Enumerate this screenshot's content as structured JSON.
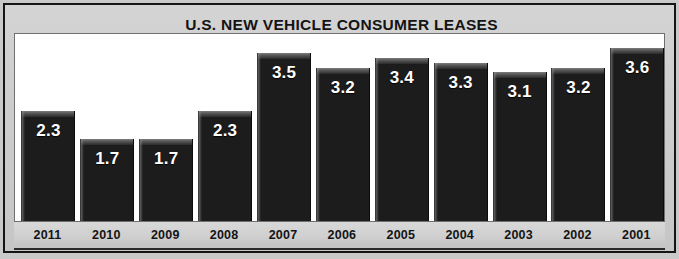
{
  "chart_data": {
    "type": "bar",
    "title": "U.S. NEW VEHICLE CONSUMER LEASES",
    "xlabel": "",
    "ylabel": "",
    "categories": [
      "2011",
      "2010",
      "2009",
      "2008",
      "2007",
      "2006",
      "2005",
      "2004",
      "2003",
      "2002",
      "2001"
    ],
    "values": [
      2.3,
      1.7,
      1.7,
      2.3,
      3.5,
      3.2,
      3.4,
      3.3,
      3.1,
      3.2,
      3.6
    ],
    "value_labels": [
      "2.3",
      "1.7",
      "1.7",
      "2.3",
      "3.5",
      "3.2",
      "3.4",
      "3.3",
      "3.1",
      "3.2",
      "3.6"
    ],
    "ylim": [
      0,
      3.9
    ],
    "grid": false,
    "legend": null,
    "bar_color": "#1c1c1c",
    "value_label_color": "#ffffff",
    "plot_background": "#ffffff",
    "panel_background": "#c9c9c9",
    "title_color": "#141414"
  },
  "panel": {
    "title": "U.S. NEW VEHICLE CONSUMER LEASES"
  }
}
